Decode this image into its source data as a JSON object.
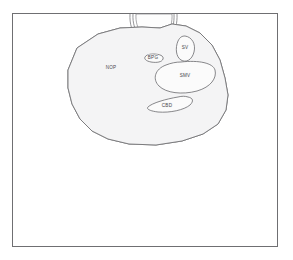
{
  "figure": {
    "caption": "",
    "canvas": {
      "width": 293,
      "height": 260
    },
    "frame": {
      "x": 12,
      "y": 13,
      "width": 266,
      "height": 234,
      "stroke_color": "#6f6f72",
      "fill_color": "#ffffff"
    },
    "fill_color": "#f4f4f5",
    "outline_color": "#6a6a6d",
    "label_color": "#4a4a4d"
  },
  "regions": [
    {
      "id": "nop",
      "label": "NOP",
      "name": "normal-pancreas-region",
      "label_x": 111,
      "label_y": 68
    },
    {
      "id": "bpg",
      "label": "BPG",
      "name": "bpg-region",
      "label_x": 153,
      "label_y": 58
    },
    {
      "id": "sv",
      "label": "SV",
      "name": "splenic-vein-region",
      "label_x": 185,
      "label_y": 48
    },
    {
      "id": "smv",
      "label": "SMV",
      "name": "superior-mesenteric-vein-region",
      "label_x": 185,
      "label_y": 76
    },
    {
      "id": "cbd",
      "label": "CBD",
      "name": "common-bile-duct-region",
      "label_x": 167,
      "label_y": 106
    }
  ],
  "probe": {
    "name": "transducer-arc",
    "visible": true
  }
}
